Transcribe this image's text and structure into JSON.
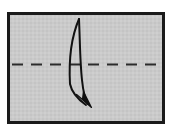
{
  "figure": {
    "type": "origami-fold-diagram",
    "title": "Valley fold diagram",
    "caption": "Rectangular sheet with horizontal dashed fold line and curved fold arrow",
    "canvas": {
      "width": 173,
      "height": 136
    },
    "background_color": "#ffffff"
  },
  "paper": {
    "name": "paper-sheet",
    "shape": "rectangle",
    "x": 7,
    "y": 12,
    "width": 158,
    "height": 112,
    "fill_color": "#c9c9c9",
    "border_color": "#1a1a1a",
    "border_width": 3
  },
  "fold_line": {
    "name": "fold-crease-line",
    "style": "dashed",
    "meaning": "valley fold crease",
    "color": "#2b2b2b",
    "stroke_width": 2,
    "y": 64,
    "x_start": 12,
    "x_end": 160,
    "dash_length": 11,
    "gap_length": 8,
    "dash_count": 9
  },
  "fold_arrow": {
    "name": "fold-direction-arrow",
    "meaning": "fold top edge down over crease",
    "color": "#111111",
    "stroke_width": 2,
    "tip_top": {
      "x": 79,
      "y": 19
    },
    "tip_bottom": {
      "x": 88,
      "y": 104
    },
    "bulge_left": {
      "x": 69,
      "y": 66
    },
    "bulge_right": {
      "x": 80,
      "y": 62
    },
    "arrowhead": {
      "name": "arrowhead",
      "shape": "filled-triangle",
      "tip": {
        "x": 91,
        "y": 107
      },
      "direction": "down-right",
      "size": 13
    }
  },
  "texture": {
    "enabled": true,
    "name": "paper-grain",
    "light": "#d0d0d0",
    "dark": "#c2c2c2"
  }
}
